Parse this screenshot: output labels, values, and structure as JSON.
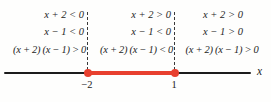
{
  "figure": {
    "regions": [
      {
        "position": "left",
        "interval": "x < -2",
        "rows": [
          "x + 2 < 0",
          "x − 1 < 0",
          "(x + 2) (x − 1) > 0"
        ]
      },
      {
        "position": "middle",
        "interval": "-2 < x < 1",
        "rows": [
          "x + 2 > 0",
          "x − 1 < 0",
          "(x + 2) (x − 1) < 0"
        ]
      },
      {
        "position": "right",
        "interval": "x > 1",
        "rows": [
          "x + 2 > 0",
          "x − 1 > 0",
          "(x + 2) (x − 1) > 0"
        ]
      }
    ],
    "number_line": {
      "axis_label": "x",
      "points": [
        {
          "label": "−2",
          "marker": "filled-red-dot"
        },
        {
          "label": "1",
          "marker": "filled-red-dot"
        }
      ],
      "highlight_segment": "from −2 to 1",
      "colors": {
        "highlight": "#e8402f",
        "line": "#1c1c1c",
        "text": "#252525"
      }
    }
  }
}
